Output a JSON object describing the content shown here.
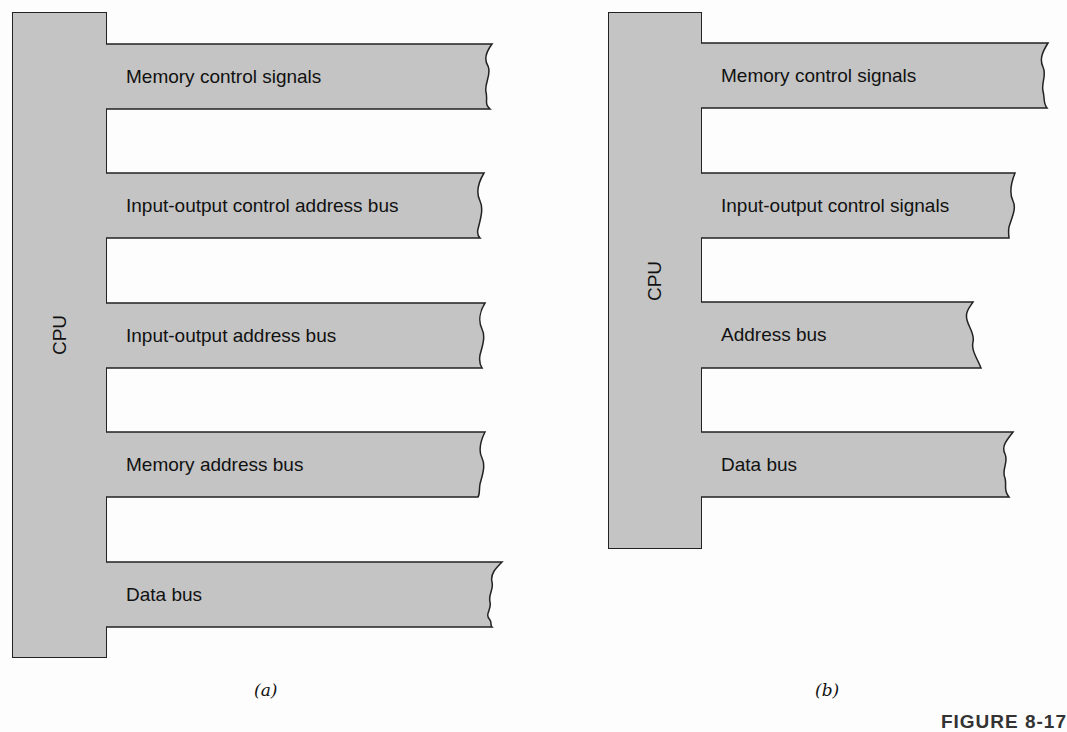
{
  "colors": {
    "fill": "#c4c4c4",
    "stroke": "#222222",
    "background": "#fdfdfd"
  },
  "panel_a": {
    "cpu_label": "CPU",
    "buses": [
      {
        "label": "Memory control signals"
      },
      {
        "label": "Input-output control address bus"
      },
      {
        "label": "Input-output address bus"
      },
      {
        "label": "Memory address bus"
      },
      {
        "label": "Data bus"
      }
    ],
    "caption": "(a)"
  },
  "panel_b": {
    "cpu_label": "CPU",
    "buses": [
      {
        "label": "Memory control signals"
      },
      {
        "label": "Input-output control signals"
      },
      {
        "label": "Address bus"
      },
      {
        "label": "Data bus"
      }
    ],
    "caption": "(b)"
  },
  "figure_label": "FIGURE 8-17"
}
